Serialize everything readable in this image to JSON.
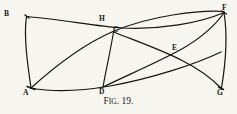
{
  "figure": {
    "caption_prefix": "F",
    "caption_small": "IG",
    "caption_suffix": ". 19.",
    "caption_full": "Fig. 19.",
    "ink_color": "#161412",
    "background_color": "#f7f5f0",
    "stroke_width": 1.15,
    "width": 237,
    "height": 114,
    "caption_top": 96,
    "points": [
      {
        "id": "B",
        "label": "B",
        "x": 26,
        "y": 16,
        "label_x": 4,
        "label_y": 10
      },
      {
        "id": "A",
        "label": "A",
        "x": 31,
        "y": 88,
        "label_x": 23,
        "label_y": 89
      },
      {
        "id": "H",
        "label": "H",
        "x": 104,
        "y": 28,
        "label_x": 99,
        "label_y": 15
      },
      {
        "id": "C",
        "label": "C",
        "x": 113,
        "y": 31,
        "label_x": 113,
        "label_y": 26
      },
      {
        "id": "D",
        "label": "D",
        "x": 103,
        "y": 87,
        "label_x": 99,
        "label_y": 88
      },
      {
        "id": "E",
        "label": "E",
        "x": 177,
        "y": 53,
        "label_x": 172,
        "label_y": 44
      },
      {
        "id": "F",
        "label": "F",
        "x": 224,
        "y": 12,
        "label_x": 222,
        "label_y": 4
      },
      {
        "id": "G",
        "label": "G",
        "x": 221,
        "y": 88,
        "label_x": 217,
        "label_y": 89
      }
    ],
    "edges": [
      {
        "id": "edge-B-A",
        "name": "edge-b-a",
        "from": "B",
        "to": "A",
        "d": "M 26.5 16.5 C 23.5 36 27.5 64 31 88",
        "width": 1.2
      },
      {
        "id": "edge-B-F",
        "name": "edge-b-h-f",
        "from": "B",
        "to": "F",
        "d": "M 26.5 16.5 C 62 19.5 96 26.5 122 28 C 160 30 200 23 224 12.5",
        "width": 1.25
      },
      {
        "id": "edge-A-F",
        "name": "edge-a-c-f",
        "from": "A",
        "to": "F",
        "d": "M 31 88 C 52 69 84 44 113 31.5 C 152 15 200 10 224 11.5",
        "width": 1.25
      },
      {
        "id": "edge-C-D",
        "name": "edge-c-d",
        "from": "C",
        "to": "D",
        "d": "M 113.5 32 C 111 48 106 70 103 87",
        "width": 1.15
      },
      {
        "id": "edge-A-G",
        "name": "edge-a-d-g",
        "from": "A",
        "to": "G",
        "d": "M 31 88 C 58 93 84 90.5 110 86 C 152 78.5 196 64 221 52",
        "width": 1.2
      },
      {
        "id": "edge-D-F",
        "name": "edge-d-e-f",
        "from": "D",
        "to": "F",
        "d": "M 103 87 C 130 74 158 62 180 50 C 203 37.5 218 22 224 12.5",
        "width": 1.2
      },
      {
        "id": "edge-C-G",
        "name": "edge-c-e-g",
        "from": "C",
        "to": "G",
        "d": "M 113.5 32 C 136 41 162 50 183 61 C 203 71 215 82 221 88",
        "width": 1.2
      },
      {
        "id": "edge-F-G",
        "name": "edge-f-g",
        "from": "F",
        "to": "G",
        "d": "M 224 12.5 C 227.5 34 225.5 64 221.5 88",
        "width": 1.2
      }
    ],
    "vertex_marks": [
      {
        "id": "mark-A",
        "name": "vertex-mark-a",
        "d": "M 27 86.5 L 35 89.5",
        "width": 1.4
      },
      {
        "id": "mark-B",
        "name": "vertex-mark-b",
        "d": "M 25 15 L 29 18",
        "width": 1.4
      },
      {
        "id": "mark-F",
        "name": "vertex-mark-f",
        "d": "M 221.5 11 L 226.5 14",
        "width": 1.4
      },
      {
        "id": "mark-G",
        "name": "vertex-mark-g",
        "d": "M 218.5 87 L 223.5 89.5",
        "width": 1.4
      }
    ]
  }
}
